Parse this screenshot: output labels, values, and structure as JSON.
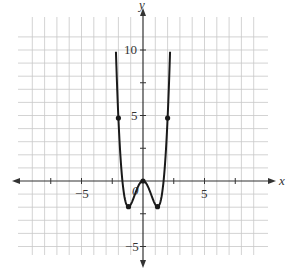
{
  "chart_data": {
    "type": "line",
    "title": "",
    "xlabel": "x",
    "ylabel": "y",
    "xlim": [
      -7,
      7
    ],
    "ylim": [
      -6,
      11
    ],
    "grid": true,
    "grid_step": 1,
    "x_ticks": [
      -5,
      5
    ],
    "y_ticks": [
      10,
      5,
      -5
    ],
    "x_tick_labels": [
      "−5",
      "5"
    ],
    "y_tick_labels": [
      "10",
      "5",
      "−5"
    ],
    "origin_label": "0",
    "series": [
      {
        "name": "f(x)",
        "description": "even quartic curve, approx f(x) = x^4 - 2.8x^2",
        "x": [
          -2.2,
          -2.0,
          -1.5,
          -1.18,
          -1.0,
          -0.5,
          0,
          0.5,
          1.0,
          1.18,
          1.5,
          2.0,
          2.2
        ],
        "values": [
          10.0,
          4.8,
          -1.2,
          -1.96,
          -1.8,
          -0.64,
          0,
          -0.64,
          -1.8,
          -1.96,
          -1.2,
          4.8,
          10.0
        ]
      }
    ],
    "marked_points": [
      {
        "x": -2,
        "y": 4.8
      },
      {
        "x": -1.18,
        "y": -1.96
      },
      {
        "x": 0,
        "y": 0
      },
      {
        "x": 1.18,
        "y": -1.96
      },
      {
        "x": 2,
        "y": 4.8
      }
    ]
  },
  "labels": {
    "x_axis": "x",
    "y_axis": "y",
    "origin": "0",
    "x_neg5": "−5",
    "x_pos5": "5",
    "y_10": "10",
    "y_5": "5",
    "y_neg5": "−5"
  },
  "colors": {
    "curve": "#1a1a1a",
    "grid": "#c8c8c8",
    "axis": "#333333"
  }
}
